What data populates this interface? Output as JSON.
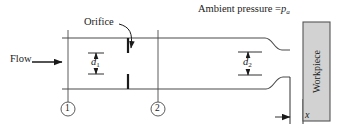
{
  "figure": {
    "type": "schematic-diagram",
    "background_color": "#ffffff",
    "line_color": "#4a4a4a",
    "text_color": "#1a1a1a",
    "workpiece_fill": "#d2d2d2",
    "workpiece_stroke": "#555555"
  },
  "labels": {
    "ambient_pressure": "Ambient pressure =",
    "ambient_pressure_symbol": "p",
    "ambient_pressure_subscript": "a",
    "orifice": "Orifice",
    "flow": "Flow",
    "d1_symbol": "d",
    "d1_subscript": "1",
    "d2_symbol": "d",
    "d2_subscript": "2",
    "gap_symbol": "x",
    "workpiece": "Workpiece",
    "station_1": "1",
    "station_2": "2"
  },
  "geometry": {
    "channel_top_y": 38,
    "channel_bottom_y": 89,
    "channel_left_x": 62,
    "flare_start_x": 265,
    "exit_x": 290,
    "workpiece_left_x": 303,
    "workpiece_right_x": 330,
    "workpiece_top_y": 22,
    "workpiece_bottom_y": 121,
    "orifice_x": 128,
    "station_1_x": 68,
    "station_2_x": 158
  }
}
